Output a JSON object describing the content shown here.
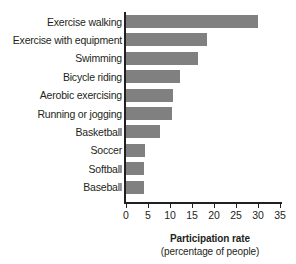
{
  "chart_data": {
    "type": "bar",
    "orientation": "horizontal",
    "title": "",
    "xlabel": "Participation rate",
    "xlabel_sub": "(percentage of people)",
    "ylabel": "",
    "xlim": [
      0,
      35
    ],
    "xticks": [
      0,
      5,
      10,
      15,
      20,
      25,
      30,
      35
    ],
    "grid": false,
    "legend": null,
    "bar_color": "#808080",
    "axis_color": "#231f20",
    "categories": [
      "Exercise walking",
      "Exercise with equipment",
      "Swimming",
      "Bicycle riding",
      "Aerobic exercising",
      "Running or jogging",
      "Basketball",
      "Soccer",
      "Softball",
      "Baseball"
    ],
    "values": [
      30.0,
      18.5,
      16.3,
      12.2,
      10.7,
      10.4,
      7.8,
      4.3,
      4.0,
      4.0
    ]
  },
  "axis": {
    "title_line1": "Participation rate",
    "title_line2": "(percentage of people)"
  }
}
